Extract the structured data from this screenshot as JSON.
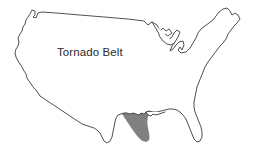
{
  "figure": {
    "type": "map",
    "title": "Tornado Belt",
    "background_color": "#ffffff"
  },
  "map": {
    "name": "united-states-outline",
    "outline_color": "#3b3b3b",
    "fill_color": "#ffffff",
    "stroke_width": "0.9"
  },
  "regions": [
    {
      "name": "tornado-belt",
      "label": "Tornado Belt",
      "fill_color": "#808080",
      "description": "Shaded band sweeping from the Great Lakes south-southwest through the Central Plains to the Gulf Coast of Texas and Louisiana"
    }
  ],
  "labels": {
    "tornado_belt": "Tornado Belt",
    "tornado_belt_x": "57",
    "tornado_belt_y": "56"
  },
  "legend": {
    "visible": false
  }
}
